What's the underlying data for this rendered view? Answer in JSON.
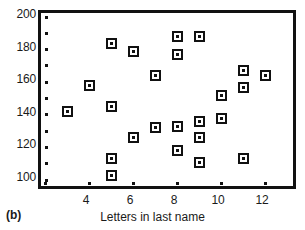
{
  "figure": {
    "panel_label": "(b)"
  },
  "chart_data": {
    "type": "scatter",
    "title": "",
    "subtitle": "",
    "xlabel": "Letters in last name",
    "ylabel": "",
    "xlim": [
      2,
      13
    ],
    "ylim": [
      96,
      201
    ],
    "grid": false,
    "legend": null,
    "x_ticks": [
      4,
      6,
      8,
      10,
      12
    ],
    "x_tick_labels": [
      "4",
      "6",
      "8",
      "10",
      "12"
    ],
    "x_minor_ticks": [
      2,
      3,
      4,
      5,
      6,
      7,
      8,
      9,
      10,
      11,
      12
    ],
    "y_ticks": [
      100,
      120,
      140,
      160,
      180,
      200
    ],
    "y_tick_labels": [
      "100",
      "120",
      "140",
      "160",
      "180",
      "200"
    ],
    "y_minor_ticks": [
      100,
      110,
      120,
      130,
      140,
      150,
      160,
      170,
      180,
      190,
      200
    ],
    "marker": "open-square",
    "marker_color": "#111111",
    "x": [
      3,
      4,
      5,
      5,
      5,
      5,
      6,
      6,
      7,
      7,
      8,
      8,
      8,
      8,
      9,
      9,
      9,
      9,
      10,
      10,
      11,
      11,
      11,
      12
    ],
    "y": [
      142,
      158,
      184,
      145,
      113,
      103,
      179,
      126,
      164,
      132,
      188,
      177,
      133,
      118,
      188,
      136,
      126,
      111,
      152,
      138,
      167,
      157,
      113,
      164
    ],
    "points": [
      {
        "x": 3,
        "y": 142
      },
      {
        "x": 4,
        "y": 158
      },
      {
        "x": 5,
        "y": 184
      },
      {
        "x": 5,
        "y": 145
      },
      {
        "x": 5,
        "y": 113
      },
      {
        "x": 5,
        "y": 103
      },
      {
        "x": 6,
        "y": 179
      },
      {
        "x": 6,
        "y": 126
      },
      {
        "x": 7,
        "y": 164
      },
      {
        "x": 7,
        "y": 132
      },
      {
        "x": 8,
        "y": 188
      },
      {
        "x": 8,
        "y": 177
      },
      {
        "x": 8,
        "y": 133
      },
      {
        "x": 8,
        "y": 118
      },
      {
        "x": 9,
        "y": 188
      },
      {
        "x": 9,
        "y": 136
      },
      {
        "x": 9,
        "y": 126
      },
      {
        "x": 9,
        "y": 111
      },
      {
        "x": 10,
        "y": 152
      },
      {
        "x": 10,
        "y": 138
      },
      {
        "x": 11,
        "y": 167
      },
      {
        "x": 11,
        "y": 157
      },
      {
        "x": 11,
        "y": 113
      },
      {
        "x": 12,
        "y": 164
      }
    ]
  }
}
